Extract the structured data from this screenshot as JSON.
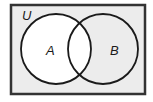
{
  "diagram": {
    "type": "venn",
    "universe": {
      "label": "U",
      "fill": "#ececec",
      "stroke": "#333333"
    },
    "sets": [
      {
        "label": "A",
        "fill": "#ffffff",
        "stroke": "#1a1a1a"
      },
      {
        "label": "B",
        "fill": "#ececec",
        "stroke": "#1a1a1a"
      }
    ],
    "shaded_region": "A"
  }
}
